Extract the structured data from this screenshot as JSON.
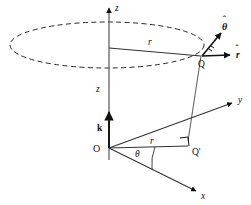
{
  "figure": {
    "background_color": "#ffffff",
    "stroke_color": "#111111",
    "labels": {
      "z_axis": "z",
      "y_axis": "y",
      "x_axis": "x",
      "height_z": "z",
      "radius_upper": "r",
      "radius_lower": "r",
      "angle_theta": "θ",
      "origin": "O",
      "point_q": "Q",
      "point_q_prime": "Q'",
      "unit_k": "k",
      "unit_r_hat": "r",
      "unit_theta_hat": "θ",
      "r_hat_accent": "ˆ",
      "theta_hat_accent": "ˆ"
    },
    "elements": {
      "dashed_circle": "dashed-ellipse",
      "right_angle_marker_qprime": "right-angle-marker",
      "right_angle_marker_q": "right-angle-tick",
      "angle_arc": "theta-arc"
    }
  }
}
